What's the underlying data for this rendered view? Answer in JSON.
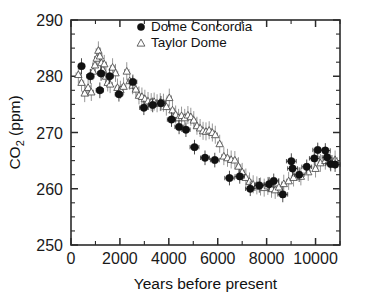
{
  "chart_data": {
    "type": "scatter",
    "title": "",
    "xlabel": "Years before present",
    "ylabel": "CO2 (ppm)",
    "ylabel_base": "CO",
    "ylabel_sub": "2",
    "ylabel_unit": " (ppm)",
    "xlim": [
      0,
      11000
    ],
    "ylim": [
      250,
      290
    ],
    "xticks": [
      0,
      2000,
      4000,
      6000,
      8000,
      10000
    ],
    "xticklabels": [
      "0",
      "2000",
      "4000",
      "6000",
      "8000",
      "10000"
    ],
    "yticks": [
      250,
      260,
      270,
      280,
      290
    ],
    "yticklabels": [
      "250",
      "260",
      "270",
      "280",
      "290"
    ],
    "x_minor_step": 1000,
    "y_minor_step": 2.5,
    "grid": false,
    "legend_position": "top-center",
    "series": [
      {
        "name": "Dome Concordia",
        "marker": "filled-circle",
        "color": "#111111",
        "points": [
          {
            "x": 430,
            "y": 281.8,
            "xerr": 130,
            "yerr": 1.4
          },
          {
            "x": 790,
            "y": 280.0,
            "xerr": 150,
            "yerr": 1.3
          },
          {
            "x": 1180,
            "y": 277.5,
            "xerr": 150,
            "yerr": 1.4
          },
          {
            "x": 1230,
            "y": 280.5,
            "xerr": 150,
            "yerr": 1.3
          },
          {
            "x": 1580,
            "y": 280.0,
            "xerr": 150,
            "yerr": 1.4
          },
          {
            "x": 1960,
            "y": 276.8,
            "xerr": 150,
            "yerr": 1.3
          },
          {
            "x": 2530,
            "y": 279.0,
            "xerr": 160,
            "yerr": 1.3
          },
          {
            "x": 2980,
            "y": 274.4,
            "xerr": 170,
            "yerr": 1.3
          },
          {
            "x": 3340,
            "y": 274.9,
            "xerr": 170,
            "yerr": 1.3
          },
          {
            "x": 3680,
            "y": 275.2,
            "xerr": 170,
            "yerr": 1.3
          },
          {
            "x": 4110,
            "y": 272.3,
            "xerr": 170,
            "yerr": 1.3
          },
          {
            "x": 4420,
            "y": 271.0,
            "xerr": 170,
            "yerr": 1.3
          },
          {
            "x": 4700,
            "y": 270.5,
            "xerr": 170,
            "yerr": 1.3
          },
          {
            "x": 5050,
            "y": 267.4,
            "xerr": 180,
            "yerr": 1.3
          },
          {
            "x": 5480,
            "y": 265.5,
            "xerr": 180,
            "yerr": 1.3
          },
          {
            "x": 5880,
            "y": 265.1,
            "xerr": 180,
            "yerr": 1.3
          },
          {
            "x": 6480,
            "y": 261.9,
            "xerr": 190,
            "yerr": 1.3
          },
          {
            "x": 6900,
            "y": 262.2,
            "xerr": 190,
            "yerr": 1.3
          },
          {
            "x": 7330,
            "y": 260.0,
            "xerr": 190,
            "yerr": 1.3
          },
          {
            "x": 7700,
            "y": 260.6,
            "xerr": 190,
            "yerr": 1.3
          },
          {
            "x": 8100,
            "y": 260.8,
            "xerr": 200,
            "yerr": 1.3
          },
          {
            "x": 8290,
            "y": 261.4,
            "xerr": 200,
            "yerr": 1.3
          },
          {
            "x": 8660,
            "y": 259.0,
            "xerr": 200,
            "yerr": 1.4
          },
          {
            "x": 9010,
            "y": 264.9,
            "xerr": 200,
            "yerr": 1.4
          },
          {
            "x": 9060,
            "y": 263.6,
            "xerr": 200,
            "yerr": 1.3
          },
          {
            "x": 9330,
            "y": 262.5,
            "xerr": 200,
            "yerr": 1.3
          },
          {
            "x": 9640,
            "y": 263.9,
            "xerr": 200,
            "yerr": 1.3
          },
          {
            "x": 9950,
            "y": 265.4,
            "xerr": 200,
            "yerr": 1.3
          },
          {
            "x": 10090,
            "y": 266.9,
            "xerr": 200,
            "yerr": 1.3
          },
          {
            "x": 10400,
            "y": 266.8,
            "xerr": 200,
            "yerr": 1.3
          },
          {
            "x": 10470,
            "y": 265.6,
            "xerr": 200,
            "yerr": 1.3
          },
          {
            "x": 10620,
            "y": 264.4,
            "xerr": 200,
            "yerr": 1.3
          },
          {
            "x": 10800,
            "y": 264.3,
            "xerr": 200,
            "yerr": 1.3
          }
        ]
      },
      {
        "name": "Taylor Dome",
        "marker": "open-triangle",
        "color": "#4a4a4a",
        "points": [
          {
            "x": 300,
            "y": 280.3,
            "xerr": 90,
            "yerr": 1.6
          },
          {
            "x": 430,
            "y": 278.9,
            "xerr": 90,
            "yerr": 1.6
          },
          {
            "x": 560,
            "y": 277.0,
            "xerr": 90,
            "yerr": 1.6
          },
          {
            "x": 700,
            "y": 278.0,
            "xerr": 90,
            "yerr": 1.6
          },
          {
            "x": 830,
            "y": 277.2,
            "xerr": 90,
            "yerr": 1.6
          },
          {
            "x": 900,
            "y": 280.9,
            "xerr": 90,
            "yerr": 1.6
          },
          {
            "x": 980,
            "y": 282.0,
            "xerr": 90,
            "yerr": 1.6
          },
          {
            "x": 1050,
            "y": 283.2,
            "xerr": 90,
            "yerr": 1.6
          },
          {
            "x": 1120,
            "y": 284.6,
            "xerr": 90,
            "yerr": 1.6
          },
          {
            "x": 1180,
            "y": 283.6,
            "xerr": 90,
            "yerr": 1.6
          },
          {
            "x": 1240,
            "y": 282.4,
            "xerr": 90,
            "yerr": 1.6
          },
          {
            "x": 1300,
            "y": 281.2,
            "xerr": 90,
            "yerr": 1.6
          },
          {
            "x": 1360,
            "y": 282.2,
            "xerr": 90,
            "yerr": 1.6
          },
          {
            "x": 1430,
            "y": 280.0,
            "xerr": 90,
            "yerr": 1.6
          },
          {
            "x": 1500,
            "y": 278.9,
            "xerr": 90,
            "yerr": 1.6
          },
          {
            "x": 1600,
            "y": 278.6,
            "xerr": 90,
            "yerr": 1.6
          },
          {
            "x": 1700,
            "y": 281.6,
            "xerr": 90,
            "yerr": 1.6
          },
          {
            "x": 1820,
            "y": 280.6,
            "xerr": 90,
            "yerr": 1.6
          },
          {
            "x": 1900,
            "y": 278.0,
            "xerr": 90,
            "yerr": 1.6
          },
          {
            "x": 2020,
            "y": 277.6,
            "xerr": 90,
            "yerr": 1.6
          },
          {
            "x": 2150,
            "y": 278.2,
            "xerr": 90,
            "yerr": 1.6
          },
          {
            "x": 2280,
            "y": 280.9,
            "xerr": 90,
            "yerr": 1.6
          },
          {
            "x": 2400,
            "y": 279.2,
            "xerr": 90,
            "yerr": 1.6
          },
          {
            "x": 2520,
            "y": 278.4,
            "xerr": 90,
            "yerr": 1.6
          },
          {
            "x": 2650,
            "y": 277.7,
            "xerr": 90,
            "yerr": 1.6
          },
          {
            "x": 2780,
            "y": 276.6,
            "xerr": 90,
            "yerr": 1.6
          },
          {
            "x": 2900,
            "y": 276.4,
            "xerr": 90,
            "yerr": 1.6
          },
          {
            "x": 3020,
            "y": 276.0,
            "xerr": 90,
            "yerr": 1.6
          },
          {
            "x": 3150,
            "y": 275.6,
            "xerr": 90,
            "yerr": 1.6
          },
          {
            "x": 3280,
            "y": 275.4,
            "xerr": 90,
            "yerr": 1.6
          },
          {
            "x": 3400,
            "y": 275.5,
            "xerr": 90,
            "yerr": 1.6
          },
          {
            "x": 3520,
            "y": 275.2,
            "xerr": 90,
            "yerr": 1.6
          },
          {
            "x": 3650,
            "y": 275.4,
            "xerr": 90,
            "yerr": 1.6
          },
          {
            "x": 3780,
            "y": 275.3,
            "xerr": 90,
            "yerr": 1.6
          },
          {
            "x": 3900,
            "y": 274.6,
            "xerr": 90,
            "yerr": 1.6
          },
          {
            "x": 4020,
            "y": 276.2,
            "xerr": 90,
            "yerr": 1.6
          },
          {
            "x": 4150,
            "y": 274.0,
            "xerr": 90,
            "yerr": 1.6
          },
          {
            "x": 4280,
            "y": 273.2,
            "xerr": 90,
            "yerr": 1.6
          },
          {
            "x": 4400,
            "y": 272.6,
            "xerr": 90,
            "yerr": 1.6
          },
          {
            "x": 4520,
            "y": 273.0,
            "xerr": 90,
            "yerr": 1.6
          },
          {
            "x": 4650,
            "y": 272.6,
            "xerr": 90,
            "yerr": 1.6
          },
          {
            "x": 4780,
            "y": 273.1,
            "xerr": 90,
            "yerr": 1.6
          },
          {
            "x": 4900,
            "y": 272.8,
            "xerr": 90,
            "yerr": 1.6
          },
          {
            "x": 5020,
            "y": 272.2,
            "xerr": 90,
            "yerr": 1.6
          },
          {
            "x": 5150,
            "y": 271.2,
            "xerr": 90,
            "yerr": 1.6
          },
          {
            "x": 5280,
            "y": 270.8,
            "xerr": 90,
            "yerr": 1.6
          },
          {
            "x": 5400,
            "y": 270.3,
            "xerr": 90,
            "yerr": 1.6
          },
          {
            "x": 5520,
            "y": 270.2,
            "xerr": 90,
            "yerr": 1.6
          },
          {
            "x": 5650,
            "y": 270.4,
            "xerr": 90,
            "yerr": 1.6
          },
          {
            "x": 5780,
            "y": 270.0,
            "xerr": 90,
            "yerr": 1.6
          },
          {
            "x": 5900,
            "y": 269.6,
            "xerr": 90,
            "yerr": 1.6
          },
          {
            "x": 6080,
            "y": 268.0,
            "xerr": 90,
            "yerr": 1.6
          },
          {
            "x": 6250,
            "y": 265.8,
            "xerr": 90,
            "yerr": 1.6
          },
          {
            "x": 6400,
            "y": 265.5,
            "xerr": 90,
            "yerr": 1.6
          },
          {
            "x": 6550,
            "y": 265.2,
            "xerr": 90,
            "yerr": 1.6
          },
          {
            "x": 6700,
            "y": 265.1,
            "xerr": 90,
            "yerr": 1.6
          },
          {
            "x": 6850,
            "y": 264.0,
            "xerr": 90,
            "yerr": 1.6
          },
          {
            "x": 7000,
            "y": 263.0,
            "xerr": 90,
            "yerr": 1.6
          },
          {
            "x": 7150,
            "y": 262.0,
            "xerr": 90,
            "yerr": 1.6
          },
          {
            "x": 7300,
            "y": 261.3,
            "xerr": 90,
            "yerr": 1.6
          },
          {
            "x": 7450,
            "y": 260.8,
            "xerr": 90,
            "yerr": 1.6
          },
          {
            "x": 7600,
            "y": 260.6,
            "xerr": 90,
            "yerr": 1.6
          },
          {
            "x": 7750,
            "y": 260.4,
            "xerr": 90,
            "yerr": 1.6
          },
          {
            "x": 7900,
            "y": 260.2,
            "xerr": 90,
            "yerr": 1.6
          },
          {
            "x": 8050,
            "y": 260.5,
            "xerr": 90,
            "yerr": 1.6
          },
          {
            "x": 8200,
            "y": 260.0,
            "xerr": 90,
            "yerr": 1.6
          },
          {
            "x": 8350,
            "y": 259.8,
            "xerr": 90,
            "yerr": 1.6
          },
          {
            "x": 8500,
            "y": 260.3,
            "xerr": 90,
            "yerr": 1.6
          },
          {
            "x": 8700,
            "y": 260.9,
            "xerr": 90,
            "yerr": 1.6
          },
          {
            "x": 8900,
            "y": 261.4,
            "xerr": 90,
            "yerr": 1.6
          },
          {
            "x": 9100,
            "y": 262.0,
            "xerr": 90,
            "yerr": 1.6
          },
          {
            "x": 9400,
            "y": 262.2,
            "xerr": 90,
            "yerr": 1.6
          },
          {
            "x": 9700,
            "y": 263.0,
            "xerr": 90,
            "yerr": 1.6
          },
          {
            "x": 10000,
            "y": 263.6,
            "xerr": 90,
            "yerr": 1.6
          },
          {
            "x": 10200,
            "y": 264.6,
            "xerr": 90,
            "yerr": 1.6
          },
          {
            "x": 10400,
            "y": 265.0,
            "xerr": 90,
            "yerr": 1.6
          },
          {
            "x": 10600,
            "y": 265.0,
            "xerr": 90,
            "yerr": 1.6
          },
          {
            "x": 10800,
            "y": 265.2,
            "xerr": 90,
            "yerr": 1.6
          }
        ]
      }
    ]
  },
  "legend": {
    "entries": [
      {
        "label": "Dome Concordia",
        "marker": "filled-circle"
      },
      {
        "label": "Taylor Dome",
        "marker": "open-triangle"
      }
    ]
  }
}
